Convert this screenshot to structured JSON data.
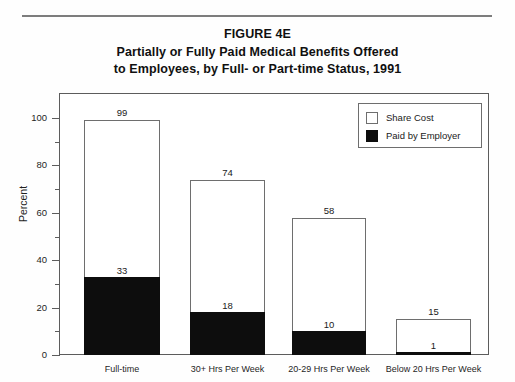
{
  "figure": {
    "top_rule": true,
    "title_lines": [
      "FIGURE 4E",
      "Partially or Fully Paid Medical Benefits Offered",
      "to Employees, by Full- or Part-time Status, 1991"
    ]
  },
  "chart_data": {
    "type": "bar",
    "stacked": true,
    "xlabel": "",
    "ylabel": "Percent",
    "ylim": [
      0,
      100
    ],
    "yticks": [
      0,
      20,
      40,
      60,
      80,
      100
    ],
    "ytick_labels": [
      "0",
      "20",
      "40",
      "60",
      "80",
      "100"
    ],
    "yminor_ticks": [
      10,
      30,
      50,
      70,
      90
    ],
    "grid": false,
    "legend_position": "top-right",
    "categories": [
      "Full-time",
      "30+ Hrs Per Week",
      "20-29 Hrs Per Week",
      "Below 20 Hrs Per Week"
    ],
    "series": [
      {
        "name": "Paid by Employer",
        "color": "#0d0d0d",
        "values": [
          33,
          18,
          10,
          1
        ]
      },
      {
        "name": "Share Cost",
        "color": "#ffffff",
        "values": [
          66,
          56,
          48,
          14
        ]
      }
    ],
    "totals": [
      99,
      74,
      58,
      15
    ],
    "bar_top_labels": [
      "99",
      "74",
      "58",
      "15"
    ],
    "bar_inner_labels": [
      "33",
      "18",
      "10",
      "1"
    ]
  },
  "legend": {
    "items": [
      {
        "label": "Share Cost",
        "swatch": "white"
      },
      {
        "label": "Paid by Employer",
        "swatch": "black"
      }
    ]
  },
  "axis": {
    "y_title": "Percent"
  }
}
